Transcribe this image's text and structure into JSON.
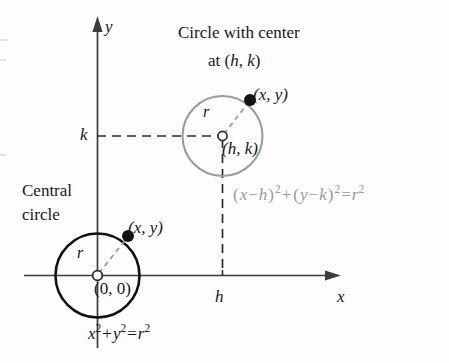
{
  "figure": {
    "title_line1": "Circle with center",
    "title_line2_prefix": "at (",
    "title_h": "h",
    "title_sep": ", ",
    "title_k": "k",
    "title_suffix": ")"
  },
  "axes": {
    "x_label": "x",
    "y_label": "y",
    "x_tick_label": "h",
    "y_tick_label": "k",
    "x_axis_color": "#3c3c3c",
    "y_axis_color": "#3c3c3c"
  },
  "central_circle": {
    "caption_line1": "Central",
    "caption_line2": "circle",
    "center_label": "(0, 0)",
    "point_label": "(x, y)",
    "radius_label": "r",
    "stroke_color": "#111111",
    "equation": {
      "term1_base": "x",
      "term1_exp": "2",
      "plus": "+",
      "term2_base": "y",
      "term2_exp": "2",
      "equals": "=",
      "rhs_base": "r",
      "rhs_exp": "2",
      "plain": "x2 + y2 = r2"
    }
  },
  "offset_circle": {
    "center_label": "(h, k)",
    "point_label": "(x, y)",
    "radius_label": "r",
    "stroke_color": "#9b9b9b",
    "equation": {
      "open1": "(",
      "x": "x",
      "minus1": "−",
      "h": "h",
      "close1": ")",
      "exp1": "2",
      "plus": "+",
      "open2": "(",
      "y": "y",
      "minus2": "−",
      "k": "k",
      "close2": ")",
      "exp2": "2",
      "equals": "=",
      "r": "r",
      "exp3": "2",
      "plain": "(x - h)2 + (y - k)2 = r2",
      "color": "#a0a0a0"
    }
  },
  "colors": {
    "background": "#fdfdfd",
    "ink": "#17181a",
    "gray_ink": "#9a9a9a",
    "dash_black": "#2b2b2b",
    "dash_gray": "#9b9b9b"
  }
}
